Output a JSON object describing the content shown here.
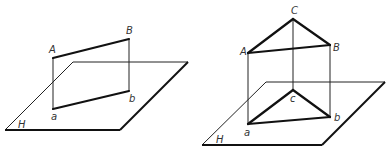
{
  "figures": [
    {
      "name": "line-segment-projection",
      "plane_label": "H",
      "points": {
        "A": "A",
        "B": "B",
        "a": "a",
        "b": "b"
      }
    },
    {
      "name": "triangle-projection",
      "plane_label": "H",
      "points": {
        "A": "A",
        "B": "B",
        "C": "C",
        "a": "a",
        "b": "b",
        "c": "c"
      }
    }
  ],
  "colors": {
    "line": "#111111",
    "label": "#333333",
    "background": "#ffffff"
  }
}
